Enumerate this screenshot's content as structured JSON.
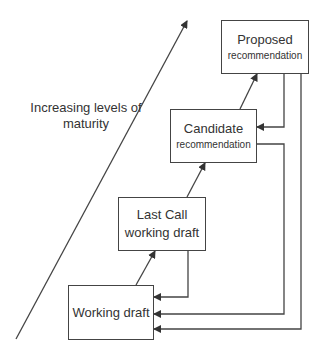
{
  "diagram": {
    "axis_label": {
      "line1": "Increasing levels of",
      "line2": "maturity"
    },
    "stages": [
      {
        "id": "working-draft",
        "title": "Working draft",
        "subtitle": ""
      },
      {
        "id": "last-call",
        "title": "Last Call",
        "subtitle": "working draft"
      },
      {
        "id": "candidate",
        "title": "Candidate",
        "subtitle": "recommendation"
      },
      {
        "id": "proposed",
        "title": "Proposed",
        "subtitle": "recommendation"
      }
    ],
    "edges": [
      {
        "from": "working-draft",
        "to": "last-call",
        "type": "advance"
      },
      {
        "from": "last-call",
        "to": "candidate",
        "type": "advance"
      },
      {
        "from": "candidate",
        "to": "proposed",
        "type": "advance"
      },
      {
        "from": "proposed",
        "to": "candidate",
        "type": "return"
      },
      {
        "from": "last-call",
        "to": "working-draft",
        "type": "return"
      },
      {
        "from": "candidate",
        "to": "working-draft",
        "type": "return"
      },
      {
        "from": "proposed",
        "to": "working-draft",
        "type": "return"
      }
    ],
    "colors": {
      "line": "#444444",
      "text": "#333333",
      "background": "#ffffff"
    }
  }
}
